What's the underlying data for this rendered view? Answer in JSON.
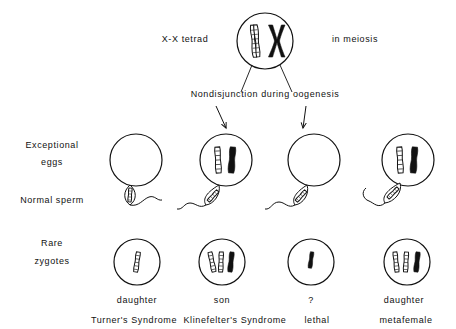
{
  "title": {
    "left_text": "X-X  tetrad",
    "right_text": "in  meiosis"
  },
  "process_label": "Nondisjunction  during  oogenesis",
  "row_labels": {
    "eggs_line1": "Exceptional",
    "eggs_line2": "eggs",
    "sperm": "Normal   sperm",
    "zygotes_line1": "Rare",
    "zygotes_line2": "zygotes"
  },
  "colors": {
    "ink": "#111111",
    "paper": "#ffffff",
    "chromosome_open": "#ffffff",
    "chromosome_solid": "#111111"
  },
  "tetrad": {
    "name": "x-x-tetrad-cell",
    "chromosomes": [
      {
        "style": "open",
        "label": "X"
      },
      {
        "style": "solid",
        "label": "X"
      }
    ]
  },
  "columns": [
    {
      "id": 1,
      "egg": {
        "chromosomes": []
      },
      "sperm": {
        "chromosomes": [
          {
            "style": "open"
          }
        ],
        "tail_direction": "right"
      },
      "zygote": {
        "chromosomes": [
          {
            "style": "open"
          }
        ]
      },
      "outcome": "daughter",
      "syndrome": "Turner's  Syndrome"
    },
    {
      "id": 2,
      "egg": {
        "chromosomes": [
          {
            "style": "open"
          },
          {
            "style": "solid"
          }
        ]
      },
      "sperm": {
        "chromosomes": [
          {
            "style": "open"
          }
        ],
        "tail_direction": "left"
      },
      "zygote": {
        "chromosomes": [
          {
            "style": "open"
          },
          {
            "style": "open"
          },
          {
            "style": "solid"
          }
        ]
      },
      "outcome": "son",
      "syndrome": "Klinefelter's  Syndrome"
    },
    {
      "id": 3,
      "egg": {
        "chromosomes": []
      },
      "sperm": {
        "chromosomes": [
          {
            "style": "open"
          }
        ],
        "tail_direction": "left"
      },
      "zygote": {
        "chromosomes": [
          {
            "style": "solid"
          }
        ]
      },
      "outcome": "?",
      "syndrome": "lethal"
    },
    {
      "id": 4,
      "egg": {
        "chromosomes": [
          {
            "style": "open"
          },
          {
            "style": "solid"
          }
        ]
      },
      "sperm": {
        "chromosomes": [
          {
            "style": "open"
          }
        ],
        "tail_direction": "left"
      },
      "zygote": {
        "chromosomes": [
          {
            "style": "open"
          },
          {
            "style": "open"
          },
          {
            "style": "solid"
          }
        ]
      },
      "outcome": "daughter",
      "syndrome": "metafemale"
    }
  ]
}
